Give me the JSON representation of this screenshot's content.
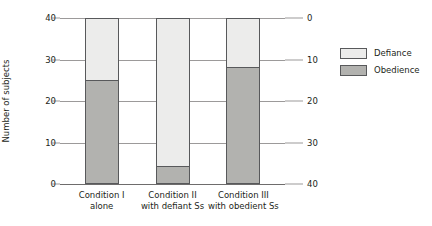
{
  "chart_data": {
    "type": "bar",
    "subtype": "stacked-bar",
    "title": "",
    "subtitle": "",
    "xlabel": "",
    "ylabel": "Number of subjects",
    "y2label": "",
    "grid": true,
    "legend_position": "right",
    "categories": [
      "Condition I\nalone",
      "Condition II\nwith defiant Ss",
      "Condition III\nwith obedient Ss"
    ],
    "category_lines": [
      [
        "Condition I",
        "alone"
      ],
      [
        "Condition II",
        "with defiant Ss"
      ],
      [
        "Condition III",
        "with obedient Ss"
      ]
    ],
    "series": [
      {
        "name": "Defiance",
        "color": "#ececeb",
        "values": [
          15,
          36,
          12
        ]
      },
      {
        "name": "Obedience",
        "color": "#b2b2af",
        "values": [
          25,
          4,
          28
        ]
      }
    ],
    "totals": [
      40,
      40,
      40
    ],
    "ylim": [
      0,
      40
    ],
    "yticks": [
      0,
      10,
      20,
      30,
      40
    ],
    "ytick_labels": [
      "0",
      "10",
      "20",
      "30",
      "40"
    ],
    "y2lim": [
      40,
      0
    ],
    "y2ticks": [
      0,
      10,
      20,
      30,
      40
    ],
    "y2tick_labels": [
      "0",
      "10",
      "20",
      "30",
      "40"
    ],
    "y2_inverted": true
  },
  "axes": {
    "left": {
      "title": "Number of subjects",
      "ticks": [
        {
          "label": "40",
          "value": 40
        },
        {
          "label": "30",
          "value": 30
        },
        {
          "label": "20",
          "value": 20
        },
        {
          "label": "10",
          "value": 10
        },
        {
          "label": "0",
          "value": 0
        }
      ]
    },
    "right": {
      "ticks": [
        {
          "label": "0",
          "value": 0
        },
        {
          "label": "10",
          "value": 10
        },
        {
          "label": "20",
          "value": 20
        },
        {
          "label": "30",
          "value": 30
        },
        {
          "label": "40",
          "value": 40
        }
      ]
    }
  },
  "legend": {
    "items": [
      {
        "label": "Defiance",
        "color": "#ececeb"
      },
      {
        "label": "Obedience",
        "color": "#b2b2af"
      }
    ]
  }
}
